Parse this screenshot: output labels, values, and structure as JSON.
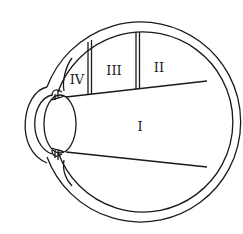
{
  "diagram": {
    "stroke_color": "#1a1a1a",
    "background": "#ffffff",
    "regions": [
      {
        "id": "I",
        "label": "I"
      },
      {
        "id": "II",
        "label": "II"
      },
      {
        "id": "III",
        "label": "III"
      },
      {
        "id": "IV",
        "label": "IV"
      }
    ]
  }
}
